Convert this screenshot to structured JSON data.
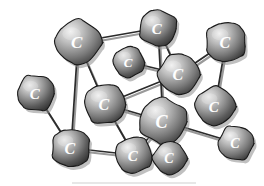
{
  "figure": {
    "width": 264,
    "height": 186,
    "background_color": "#ffffff",
    "atom_label": "C",
    "bond_color": "#2b2b2b",
    "atom_light_color": "#d9d9d9",
    "atom_mid_color": "#8a8a8a",
    "atom_dark_color": "#3a3a3a",
    "atom_outline_color": "#1a1a1a",
    "label_color": "#ffffff",
    "shadow_color": "#8d8d8d"
  },
  "atoms": [
    {
      "id": "a1",
      "name": "carbon-atom-top-left",
      "label": "C",
      "cx": 78,
      "cy": 42,
      "r": 23,
      "font_size": 17
    },
    {
      "id": "a2",
      "name": "carbon-atom-top-center",
      "label": "C",
      "cx": 158,
      "cy": 28,
      "r": 19,
      "font_size": 15
    },
    {
      "id": "a3",
      "name": "carbon-atom-top-right",
      "label": "C",
      "cx": 226,
      "cy": 42,
      "r": 21,
      "font_size": 16
    },
    {
      "id": "a4",
      "name": "carbon-atom-small-center-upper",
      "label": "C",
      "cx": 129,
      "cy": 62,
      "r": 16,
      "font_size": 13
    },
    {
      "id": "a5",
      "name": "carbon-atom-center-right-upper",
      "label": "C",
      "cx": 179,
      "cy": 74,
      "r": 21,
      "font_size": 16
    },
    {
      "id": "a6",
      "name": "carbon-atom-left-edge",
      "label": "C",
      "cx": 36,
      "cy": 93,
      "r": 19,
      "font_size": 15
    },
    {
      "id": "a7",
      "name": "carbon-atom-center-left",
      "label": "C",
      "cx": 105,
      "cy": 104,
      "r": 21,
      "font_size": 16
    },
    {
      "id": "a8",
      "name": "carbon-atom-right-middle",
      "label": "C",
      "cx": 215,
      "cy": 106,
      "r": 20,
      "font_size": 15
    },
    {
      "id": "a9",
      "name": "carbon-atom-center-hub",
      "label": "C",
      "cx": 163,
      "cy": 121,
      "r": 24,
      "font_size": 18
    },
    {
      "id": "a10",
      "name": "carbon-atom-bottom-left",
      "label": "C",
      "cx": 71,
      "cy": 148,
      "r": 20,
      "font_size": 16
    },
    {
      "id": "a11",
      "name": "carbon-atom-bottom-center",
      "label": "C",
      "cx": 134,
      "cy": 155,
      "r": 19,
      "font_size": 15
    },
    {
      "id": "a12",
      "name": "carbon-atom-bottom-small",
      "label": "C",
      "cx": 170,
      "cy": 158,
      "r": 17,
      "font_size": 14
    },
    {
      "id": "a13",
      "name": "carbon-atom-bottom-right",
      "label": "C",
      "cx": 236,
      "cy": 143,
      "r": 18,
      "font_size": 14
    }
  ],
  "bonds": [
    {
      "name": "bond-top-left-to-top-center",
      "from": "a1",
      "to": "a2"
    },
    {
      "name": "bond-top-left-to-center-left",
      "from": "a1",
      "to": "a7"
    },
    {
      "name": "bond-top-left-to-bottom-left",
      "from": "a1",
      "to": "a10"
    },
    {
      "name": "bond-top-center-to-center-right",
      "from": "a2",
      "to": "a5"
    },
    {
      "name": "bond-top-center-to-center-hub",
      "from": "a2",
      "to": "a9"
    },
    {
      "name": "bond-top-right-to-center-right",
      "from": "a3",
      "to": "a5"
    },
    {
      "name": "bond-top-right-to-right-middle",
      "from": "a3",
      "to": "a8"
    },
    {
      "name": "bond-small-upper-to-center-right",
      "from": "a4",
      "to": "a5"
    },
    {
      "name": "bond-center-right-to-center-left",
      "from": "a5",
      "to": "a7"
    },
    {
      "name": "bond-left-edge-to-bottom-left",
      "from": "a6",
      "to": "a10"
    },
    {
      "name": "bond-center-left-to-center-hub",
      "from": "a7",
      "to": "a9"
    },
    {
      "name": "bond-center-hub-to-bottom-center",
      "from": "a9",
      "to": "a11"
    },
    {
      "name": "bond-center-hub-to-bottom-small",
      "from": "a9",
      "to": "a12"
    },
    {
      "name": "bond-center-hub-to-bottom-right",
      "from": "a9",
      "to": "a13"
    },
    {
      "name": "bond-bottom-left-to-bottom-center",
      "from": "a10",
      "to": "a11"
    },
    {
      "name": "bond-bottom-center-to-center-left",
      "from": "a11",
      "to": "a7"
    }
  ]
}
